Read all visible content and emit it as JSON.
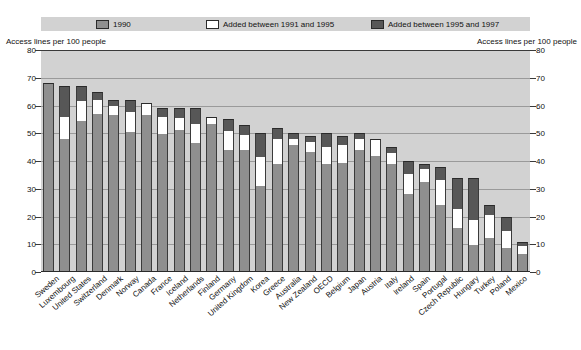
{
  "chart_data": {
    "type": "bar",
    "stacked": true,
    "title": "",
    "xlabel": "",
    "ylabel": "Access lines per 100 people",
    "ylabel_right": "Access lines per 100 people",
    "ylim": [
      0,
      80
    ],
    "yticks": [
      0,
      10,
      20,
      30,
      40,
      50,
      60,
      70,
      80
    ],
    "grid": true,
    "legend_position": "top",
    "categories": [
      "Sweden",
      "Luxembourg",
      "United States",
      "Switzerland",
      "Denmark",
      "Norway",
      "Canada",
      "France",
      "Iceland",
      "Netherlands",
      "Finland",
      "Germany",
      "United Kingdom",
      "Korea",
      "Greece",
      "Australia",
      "New Zealand",
      "OECD",
      "Belgium",
      "Japan",
      "Austria",
      "Italy",
      "Ireland",
      "Spain",
      "Portugal",
      "Czech Republic",
      "Hungary",
      "Turkey",
      "Poland",
      "Mexico"
    ],
    "series": [
      {
        "name": "1990",
        "color": "#8f8f8f",
        "values": [
          68.0,
          48.1,
          54.5,
          57.1,
          56.6,
          50.3,
          56.5,
          49.6,
          51.3,
          46.4,
          53.5,
          44.1,
          44.1,
          31.0,
          38.9,
          45.6,
          43.4,
          38.8,
          39.3,
          44.1,
          41.8,
          38.8,
          28.1,
          32.4,
          24.2,
          15.8,
          9.6,
          12.2,
          8.6,
          6.4
        ]
      },
      {
        "name": "Added between 1991 and 1995",
        "color": "#ffffff",
        "values": [
          0.0,
          7.9,
          7.3,
          4.9,
          3.4,
          7.4,
          4.0,
          6.1,
          4.3,
          6.9,
          2.1,
          6.8,
          5.1,
          10.3,
          9.2,
          2.2,
          3.3,
          6.4,
          6.5,
          3.7,
          5.7,
          4.2,
          7.3,
          4.6,
          9.1,
          7.0,
          9.3,
          8.4,
          6.1,
          2.8
        ]
      },
      {
        "name": "Added between 1995 and 1997",
        "color": "#575757",
        "values": [
          0.0,
          11.0,
          5.2,
          3.0,
          2.0,
          4.3,
          0.5,
          3.3,
          3.4,
          5.7,
          0.4,
          4.1,
          3.8,
          8.7,
          3.9,
          2.2,
          2.3,
          4.8,
          3.2,
          2.2,
          0.5,
          2.0,
          4.6,
          2.0,
          4.7,
          11.2,
          15.1,
          3.4,
          5.3,
          1.8
        ]
      }
    ],
    "totals": [
      68.0,
      67.0,
      67.0,
      65.0,
      62.0,
      62.0,
      61.0,
      59.0,
      59.0,
      59.0,
      56.0,
      55.0,
      53.0,
      50.0,
      52.0,
      50.0,
      49.0,
      50.0,
      49.0,
      50.0,
      48.0,
      45.0,
      40.0,
      39.0,
      38.0,
      34.0,
      34.0,
      24.0,
      20.0,
      11.0
    ]
  },
  "legend": {
    "items": [
      {
        "label": "1990",
        "swatch": "sw-1990"
      },
      {
        "label": "Added between 1991 and 1995",
        "swatch": "sw-9195"
      },
      {
        "label": "Added between 1995 and 1997",
        "swatch": "sw-9597"
      }
    ]
  },
  "axes": {
    "left_title": "Access lines per 100 people",
    "right_title": "Access lines per 100 people",
    "ticks": [
      "80",
      "70",
      "60",
      "50",
      "40",
      "30",
      "20",
      "10",
      "0"
    ]
  },
  "colors": {
    "plot_background": "#d2d2d2",
    "series_1990": "#8f8f8f",
    "series_1991_1995": "#ffffff",
    "series_1995_1997": "#575757",
    "gridline": "#9a9a9a",
    "axis": "#2a2a2a"
  }
}
